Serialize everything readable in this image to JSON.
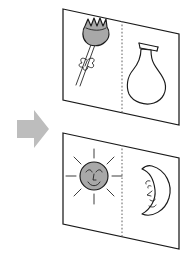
{
  "figure": {
    "title": "Picture-card matching pairs",
    "description": "A gray right-pointing arrow points toward two stacked white picture cards. The upper card shows a flower on the left half and a vase on the right half. The lower card shows a smiling sun on the left half and a crescent moon on the right half. Each card is divided by a vertical dotted line.",
    "background_color": "#ffffff",
    "ink_color": "#1a1a1a",
    "card_fill": "#ffffff",
    "arrow_color": "#bdbdbd",
    "shade_gray": "#a8a8a8",
    "divider_color": "#6e6e6e"
  },
  "arrow": {
    "name": "right-arrow",
    "label": "points to cards",
    "direction": "right",
    "color": "#bdbdbd"
  },
  "cards": [
    {
      "id": "card-top",
      "label": "Flower and vase card",
      "divider_style": "dotted",
      "panels": [
        {
          "side": "left",
          "item": "flower",
          "label": "Flower",
          "shaded": true,
          "shade_color": "#a8a8a8"
        },
        {
          "side": "right",
          "item": "vase",
          "label": "Vase",
          "shaded": false
        }
      ]
    },
    {
      "id": "card-bottom",
      "label": "Sun and moon card",
      "divider_style": "dotted",
      "panels": [
        {
          "side": "left",
          "item": "sun",
          "label": "Sun with face",
          "shaded": true,
          "shade_color": "#a8a8a8"
        },
        {
          "side": "right",
          "item": "moon",
          "label": "Crescent moon with face",
          "shaded": false
        }
      ]
    }
  ]
}
